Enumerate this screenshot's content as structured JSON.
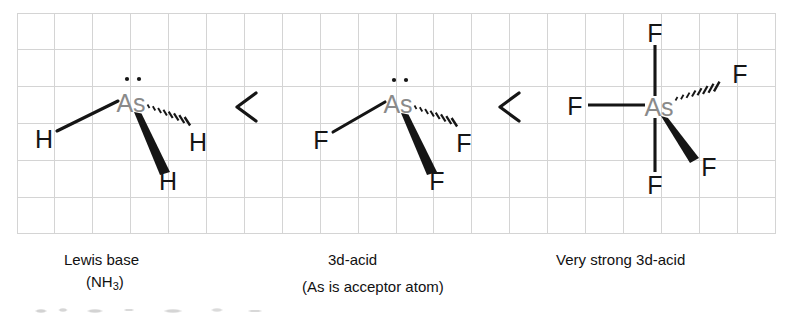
{
  "figure": {
    "width": 786,
    "height": 318,
    "background_color": "#ffffff",
    "ink_color": "#111111",
    "central_atom_color": "#8a8a8a",
    "grid": {
      "visible": true,
      "line_color": "#d4d4d4",
      "left": 17,
      "top": 13,
      "right": 775,
      "bottom": 234,
      "cell_width": 37.9,
      "cell_height": 36.8,
      "columns": 20,
      "rows": 6
    }
  },
  "relation": {
    "operator_symbol": "<",
    "operators": [
      {
        "name": "less-than-1",
        "x": 245,
        "y": 107
      },
      {
        "name": "less-than-2",
        "x": 508,
        "y": 107
      }
    ]
  },
  "molecules": [
    {
      "id": "ash3",
      "name": "arsine",
      "center_atom": "As",
      "center": {
        "x": 131,
        "y": 104
      },
      "lone_pair": {
        "dots": 2,
        "x": 133,
        "y": 79
      },
      "substituent_label": "H",
      "substituents": [
        {
          "label": "H",
          "bond": "plain",
          "x": 44,
          "y": 139
        },
        {
          "label": "H",
          "bond": "hashed",
          "x": 196,
          "y": 142
        },
        {
          "label": "H",
          "bond": "wedge",
          "x": 168,
          "y": 180
        }
      ]
    },
    {
      "id": "asf3",
      "name": "arsenic trifluoride",
      "center_atom": "As",
      "center": {
        "x": 398,
        "y": 105
      },
      "lone_pair": {
        "dots": 2,
        "x": 400,
        "y": 80
      },
      "substituent_label": "F",
      "substituents": [
        {
          "label": "F",
          "bond": "plain",
          "x": 320,
          "y": 140
        },
        {
          "label": "F",
          "bond": "hashed",
          "x": 462,
          "y": 143
        },
        {
          "label": "F",
          "bond": "wedge",
          "x": 437,
          "y": 180
        }
      ]
    },
    {
      "id": "asf5",
      "name": "arsenic pentafluoride",
      "center_atom": "As",
      "center": {
        "x": 659,
        "y": 108
      },
      "lone_pair": {
        "dots": 0
      },
      "substituent_label": "F",
      "substituents": [
        {
          "label": "F",
          "bond": "plain-up",
          "x": 655,
          "y": 34
        },
        {
          "label": "F",
          "bond": "plain-left",
          "x": 575,
          "y": 107
        },
        {
          "label": "F",
          "bond": "plain-down",
          "x": 655,
          "y": 186
        },
        {
          "label": "F",
          "bond": "hashed",
          "x": 740,
          "y": 74
        },
        {
          "label": "F",
          "bond": "wedge",
          "x": 707,
          "y": 166
        }
      ]
    }
  ],
  "captions": {
    "lewis_base": "Lewis base",
    "lewis_base_formula_pre": "(NH",
    "lewis_base_formula_sub": "3",
    "lewis_base_formula_post": ")",
    "acid_middle": "3d-acid",
    "acid_right": "Very strong 3d-acid",
    "acceptor_note": "(As is acceptor atom)"
  }
}
